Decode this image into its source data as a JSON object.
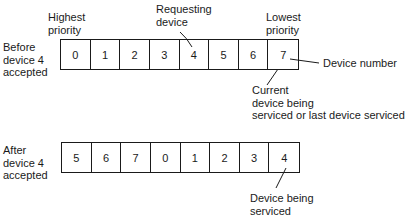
{
  "before": {
    "row_label": "Before\ndevice 4\naccepted",
    "cells": [
      "0",
      "1",
      "2",
      "3",
      "4",
      "5",
      "6",
      "7"
    ],
    "annotations": {
      "highest": "Highest\npriority",
      "requesting": "Requesting\ndevice",
      "lowest": "Lowest\npriority",
      "device_number": "Device number",
      "current": "Current\ndevice being\nserviced or last device serviced"
    }
  },
  "after": {
    "row_label": "After\ndevice 4\naccepted",
    "cells": [
      "5",
      "6",
      "7",
      "0",
      "1",
      "2",
      "3",
      "4"
    ],
    "annotations": {
      "being_serviced": "Device being\nserviced"
    }
  }
}
